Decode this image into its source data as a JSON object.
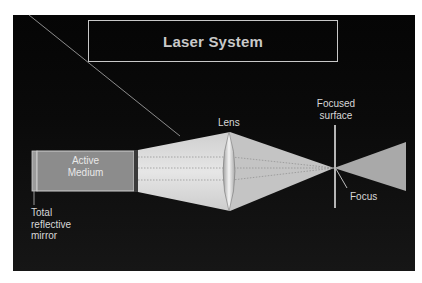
{
  "title": "Laser System",
  "components": {
    "active_medium": {
      "line1": "Active",
      "line2": "Medium"
    },
    "lens": "Lens",
    "focused_surface": {
      "line1": "Focused",
      "line2": "surface"
    },
    "focus": "Focus",
    "mirror": {
      "line1": "Total",
      "line2": "reflective",
      "line3": "mirror"
    }
  },
  "colors": {
    "background": "#0a0a0a",
    "beam": "#d9d9d9",
    "active_medium": "#8a8a8a",
    "text": "#d8d8d8"
  }
}
